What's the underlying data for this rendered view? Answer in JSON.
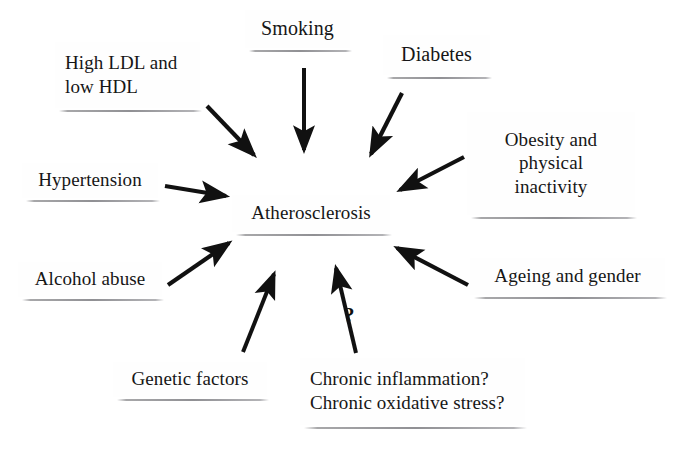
{
  "diagram": {
    "type": "radial-converging-flowchart",
    "background_color": "#ffffff",
    "text_color": "#161616",
    "arrow_color": "#111111",
    "center": {
      "id": "atherosclerosis",
      "label": "Atherosclerosis"
    },
    "annotations": [
      {
        "id": "uncertainty-marker",
        "text": "?"
      }
    ],
    "factors": [
      {
        "id": "ldl",
        "lines": [
          "High LDL and",
          "low HDL"
        ],
        "align": "left",
        "arrow_to_center": true
      },
      {
        "id": "smoking",
        "lines": [
          "Smoking"
        ],
        "align": "center",
        "arrow_to_center": true
      },
      {
        "id": "diabetes",
        "lines": [
          "Diabetes"
        ],
        "align": "center",
        "arrow_to_center": true
      },
      {
        "id": "obesity",
        "lines": [
          "Obesity and",
          "physical",
          "inactivity"
        ],
        "align": "center",
        "arrow_to_center": true
      },
      {
        "id": "hypertension",
        "lines": [
          "Hypertension"
        ],
        "align": "center",
        "arrow_to_center": true
      },
      {
        "id": "ageing",
        "lines": [
          "Ageing and gender"
        ],
        "align": "center",
        "arrow_to_center": true
      },
      {
        "id": "alcohol",
        "lines": [
          "Alcohol abuse"
        ],
        "align": "center",
        "arrow_to_center": true
      },
      {
        "id": "genetic",
        "lines": [
          "Genetic factors"
        ],
        "align": "center",
        "arrow_to_center": true
      },
      {
        "id": "chronic",
        "lines": [
          "Chronic inflammation?",
          "Chronic oxidative stress?"
        ],
        "align": "left",
        "arrow_to_center": true,
        "arrow_label": "?"
      }
    ]
  }
}
